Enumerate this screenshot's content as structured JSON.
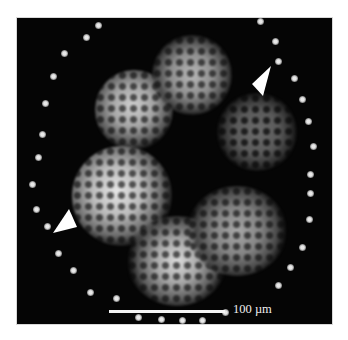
{
  "figure": {
    "type": "fluorescence micrograph",
    "background_color": "#050505",
    "scale_bar": {
      "label": "100 µm",
      "color": "#f4f4f4"
    },
    "annotations": [
      {
        "kind": "arrowhead",
        "position": "upper-right",
        "color": "#ffffff"
      },
      {
        "kind": "arrowhead",
        "position": "lower-left",
        "color": "#ffffff"
      }
    ]
  }
}
